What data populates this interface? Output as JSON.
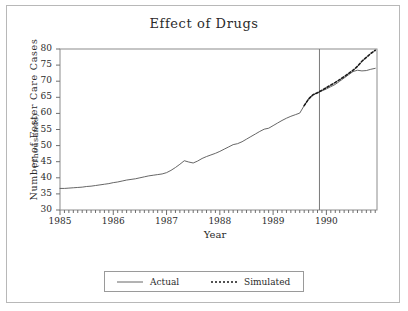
{
  "chart_data": {
    "type": "line",
    "title": "Effect of Drugs",
    "xlabel": "Year",
    "ylabel": "Number of Foster Care Cases",
    "ylabel_sub": "(Thousands)",
    "xlim": [
      1985.0,
      1990.95
    ],
    "ylim": [
      30,
      80
    ],
    "yticks": [
      30,
      35,
      40,
      45,
      50,
      55,
      60,
      65,
      70,
      75,
      80
    ],
    "xticks": [
      1985,
      1986,
      1987,
      1988,
      1989,
      1990
    ],
    "xminor_interval_months": 1,
    "grid": false,
    "legend_position": "below-plot-center",
    "annotations": [
      {
        "type": "vertical-reference-line",
        "x": 1989.87,
        "label": ""
      }
    ],
    "series": [
      {
        "name": "Actual",
        "style": "solid",
        "color": "#555555",
        "x": [
          1985.0,
          1985.083,
          1985.167,
          1985.25,
          1985.333,
          1985.417,
          1985.5,
          1985.583,
          1985.667,
          1985.75,
          1985.833,
          1985.917,
          1986.0,
          1986.083,
          1986.167,
          1986.25,
          1986.333,
          1986.417,
          1986.5,
          1986.583,
          1986.667,
          1986.75,
          1986.833,
          1986.917,
          1987.0,
          1987.083,
          1987.167,
          1987.25,
          1987.333,
          1987.417,
          1987.5,
          1987.583,
          1987.667,
          1987.75,
          1987.833,
          1987.917,
          1988.0,
          1988.083,
          1988.167,
          1988.25,
          1988.333,
          1988.417,
          1988.5,
          1988.583,
          1988.667,
          1988.75,
          1988.833,
          1988.917,
          1989.0,
          1989.083,
          1989.167,
          1989.25,
          1989.333,
          1989.417,
          1989.5,
          1989.583,
          1989.667,
          1989.75,
          1989.833,
          1989.917,
          1990.0,
          1990.083,
          1990.167,
          1990.25,
          1990.333,
          1990.417,
          1990.5,
          1990.583,
          1990.667,
          1990.75,
          1990.833,
          1990.917
        ],
        "y": [
          36.7,
          36.7,
          36.8,
          36.9,
          37.0,
          37.1,
          37.3,
          37.4,
          37.6,
          37.8,
          38.0,
          38.2,
          38.5,
          38.7,
          39.0,
          39.3,
          39.5,
          39.7,
          40.0,
          40.3,
          40.6,
          40.8,
          41.0,
          41.2,
          41.6,
          42.3,
          43.2,
          44.2,
          45.3,
          44.9,
          44.6,
          45.2,
          46.0,
          46.6,
          47.1,
          47.6,
          48.2,
          48.9,
          49.6,
          50.3,
          50.6,
          51.2,
          52.0,
          52.8,
          53.6,
          54.4,
          55.1,
          55.4,
          56.2,
          57.0,
          57.8,
          58.5,
          59.1,
          59.6,
          60.1,
          62.4,
          64.5,
          65.8,
          66.4,
          67.0,
          67.6,
          68.3,
          69.0,
          70.0,
          71.0,
          72.0,
          73.0,
          73.4,
          73.2,
          73.3,
          73.7,
          74.0
        ]
      },
      {
        "name": "Simulated",
        "style": "dotted",
        "color": "#1a1a1a",
        "x": [
          1989.583,
          1989.667,
          1989.75,
          1989.833,
          1989.917,
          1990.0,
          1990.083,
          1990.167,
          1990.25,
          1990.333,
          1990.417,
          1990.5,
          1990.583,
          1990.667,
          1990.75,
          1990.833,
          1990.917
        ],
        "y": [
          62.4,
          64.5,
          65.8,
          66.4,
          67.2,
          68.0,
          68.8,
          69.6,
          70.5,
          71.4,
          72.4,
          73.4,
          74.6,
          76.2,
          77.4,
          78.6,
          79.6
        ]
      }
    ]
  },
  "legend": {
    "items": [
      {
        "label": "Actual",
        "style": "solid"
      },
      {
        "label": "Simulated",
        "style": "dotted"
      }
    ]
  }
}
